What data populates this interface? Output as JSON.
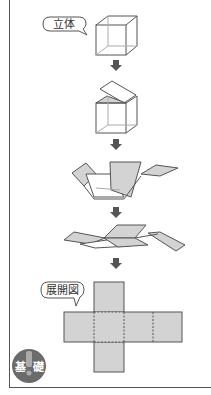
{
  "diagram": {
    "label_solid": "立体",
    "label_net": "展開図",
    "badge_left": "基",
    "badge_right": "礎",
    "steps": [
      "solid-cube",
      "lid-opening",
      "faces-unfolding",
      "faces-flattening",
      "cube-net"
    ],
    "colors": {
      "face_fill": "#d3d3d3",
      "line": "#555555",
      "arrow": "#555555",
      "badge": "#6b6b6b"
    }
  }
}
